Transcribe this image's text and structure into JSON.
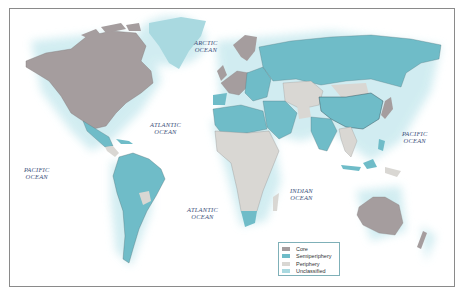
{
  "map": {
    "title": "World-system classification of countries",
    "oceans": [
      {
        "id": "arctic",
        "line1": "ARCTIC",
        "line2": "OCEAN",
        "x": 196,
        "y": 34
      },
      {
        "id": "atlantic-north",
        "line1": "ATLANTIC",
        "line2": "OCEAN",
        "x": 153,
        "y": 117
      },
      {
        "id": "pacific-east",
        "line1": "PACIFIC",
        "line2": "OCEAN",
        "x": 24,
        "y": 164
      },
      {
        "id": "atlantic-south",
        "line1": "ATLANTIC",
        "line2": "OCEAN",
        "x": 188,
        "y": 204
      },
      {
        "id": "indian",
        "line1": "INDIAN",
        "line2": "OCEAN",
        "x": 292,
        "y": 186
      },
      {
        "id": "pacific-west",
        "line1": "PACIFIC",
        "line2": "OCEAN",
        "x": 404,
        "y": 129
      }
    ],
    "colors": {
      "core": "#a59d9e",
      "semiperiphery": "#6fbcc8",
      "periphery": "#d9d7d3",
      "unclassified": "#a9d9e0",
      "halo": "#d3eef2",
      "border": "#5a6d72"
    },
    "legend": {
      "items": [
        {
          "label": "Core",
          "color": "#a59d9e"
        },
        {
          "label": "Semiperiphery",
          "color": "#6fbcc8"
        },
        {
          "label": "Periphery",
          "color": "#d9d7d3"
        },
        {
          "label": "Unclassified",
          "color": "#a9d9e0"
        }
      ]
    }
  }
}
